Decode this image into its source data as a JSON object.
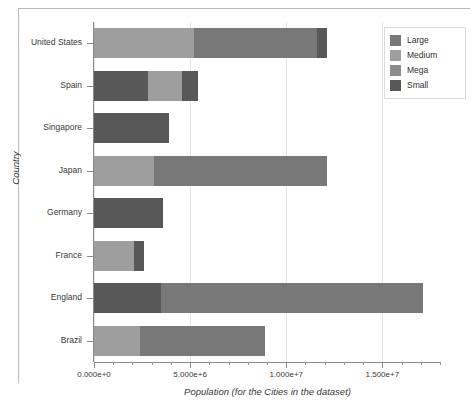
{
  "chart_data": {
    "type": "bar",
    "orientation": "horizontal",
    "stacked": true,
    "title": "",
    "xlabel": "Population (for the Cities in the dataset)",
    "ylabel": "Country",
    "categories": [
      "United States",
      "Spain",
      "Singapore",
      "Japan",
      "Germany",
      "France",
      "England",
      "Brazil"
    ],
    "series": [
      {
        "name": "Large",
        "color": "#787878",
        "values": [
          6400000,
          0,
          0,
          9000000,
          0,
          0,
          13600000,
          6500000
        ]
      },
      {
        "name": "Medium",
        "color": "#9e9e9e",
        "values": [
          5200000,
          1800000,
          0,
          3100000,
          0,
          2100000,
          0,
          2400000
        ]
      },
      {
        "name": "Mega",
        "color": "#8c8c8c",
        "values": [
          0,
          0,
          0,
          0,
          0,
          0,
          0,
          0
        ]
      },
      {
        "name": "Small",
        "color": "#585858",
        "values": [
          500000,
          3600000,
          3900000,
          0,
          3600000,
          500000,
          3500000,
          0
        ]
      }
    ],
    "stack_order": [
      "Medium",
      "Small",
      "Large",
      "Small"
    ],
    "bars": [
      {
        "country": "United States",
        "total": 12100000,
        "segments": [
          {
            "label": "Medium",
            "value": 5200000,
            "start": 0,
            "end": 5200000,
            "color": "#9e9e9e"
          },
          {
            "label": "Large",
            "value": 6400000,
            "start": 5200000,
            "end": 11600000,
            "color": "#787878"
          },
          {
            "label": "Small",
            "value": 500000,
            "start": 11600000,
            "end": 12100000,
            "color": "#585858"
          }
        ]
      },
      {
        "country": "Spain",
        "total": 5400000,
        "segments": [
          {
            "label": "Small",
            "value": 2800000,
            "start": 0,
            "end": 2800000,
            "color": "#585858"
          },
          {
            "label": "Medium",
            "value": 1800000,
            "start": 2800000,
            "end": 4600000,
            "color": "#9e9e9e"
          },
          {
            "label": "Small",
            "value": 800000,
            "start": 4600000,
            "end": 5400000,
            "color": "#585858"
          }
        ]
      },
      {
        "country": "Singapore",
        "total": 3900000,
        "segments": [
          {
            "label": "Small",
            "value": 3900000,
            "start": 0,
            "end": 3900000,
            "color": "#585858"
          }
        ]
      },
      {
        "country": "Japan",
        "total": 12100000,
        "segments": [
          {
            "label": "Medium",
            "value": 3100000,
            "start": 0,
            "end": 3100000,
            "color": "#9e9e9e"
          },
          {
            "label": "Large",
            "value": 9000000,
            "start": 3100000,
            "end": 12100000,
            "color": "#787878"
          }
        ]
      },
      {
        "country": "Germany",
        "total": 3600000,
        "segments": [
          {
            "label": "Small",
            "value": 3600000,
            "start": 0,
            "end": 3600000,
            "color": "#585858"
          }
        ]
      },
      {
        "country": "France",
        "total": 2600000,
        "segments": [
          {
            "label": "Medium",
            "value": 2100000,
            "start": 0,
            "end": 2100000,
            "color": "#9e9e9e"
          },
          {
            "label": "Small",
            "value": 500000,
            "start": 2100000,
            "end": 2600000,
            "color": "#585858"
          }
        ]
      },
      {
        "country": "England",
        "total": 17100000,
        "segments": [
          {
            "label": "Small",
            "value": 3500000,
            "start": 0,
            "end": 3500000,
            "color": "#585858"
          },
          {
            "label": "Large",
            "value": 13600000,
            "start": 3500000,
            "end": 17100000,
            "color": "#787878"
          }
        ]
      },
      {
        "country": "Brazil",
        "total": 8900000,
        "segments": [
          {
            "label": "Medium",
            "value": 2400000,
            "start": 0,
            "end": 2400000,
            "color": "#9e9e9e"
          },
          {
            "label": "Large",
            "value": 6500000,
            "start": 2400000,
            "end": 8900000,
            "color": "#787878"
          }
        ]
      }
    ],
    "xlim": [
      0,
      18000000
    ],
    "xticks": [
      0,
      5000000,
      10000000,
      15000000
    ],
    "xtick_labels": [
      "0.000e+0",
      "5.000e+6",
      "1.000e+7",
      "1.500e+7"
    ],
    "xtick_minor_count": 4,
    "grid": "vertical",
    "legend_position": "top-right"
  },
  "legend": {
    "entries": [
      {
        "label": "Large",
        "color": "#787878"
      },
      {
        "label": "Medium",
        "color": "#9e9e9e"
      },
      {
        "label": "Mega",
        "color": "#8c8c8c"
      },
      {
        "label": "Small",
        "color": "#585858"
      }
    ]
  },
  "axes": {
    "x_title": "Population (for the Cities in the dataset)",
    "y_title": "Country"
  }
}
